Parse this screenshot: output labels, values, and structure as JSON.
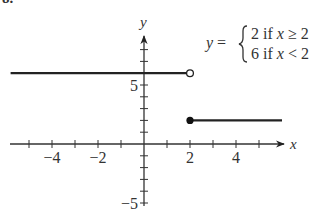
{
  "problem_number": "8.",
  "equation": {
    "lhs": "y =",
    "cases": [
      "2 if x ≥ 2",
      "6 if x < 2"
    ]
  },
  "chart_data": {
    "type": "line",
    "title": "",
    "xlabel": "x",
    "ylabel": "y",
    "xlim": [
      -5.8,
      6
    ],
    "ylim": [
      -5.3,
      8.8
    ],
    "x_ticks": [
      -5,
      -4,
      -3,
      -2,
      -1,
      1,
      2,
      3,
      4,
      5
    ],
    "x_tick_labels": [
      {
        "value": -4,
        "label": "−4"
      },
      {
        "value": -2,
        "label": "−2"
      },
      {
        "value": 2,
        "label": "2"
      },
      {
        "value": 4,
        "label": "4"
      }
    ],
    "y_ticks": [
      -5,
      -4,
      -3,
      -2,
      -1,
      1,
      2,
      3,
      4,
      5,
      6,
      7,
      8
    ],
    "y_tick_labels": [
      {
        "value": 5,
        "label": "5"
      },
      {
        "value": -5,
        "label": "−5"
      }
    ],
    "grid": false,
    "series": [
      {
        "name": "6 if x < 2",
        "x": [
          -5.8,
          2
        ],
        "y": [
          6,
          6
        ],
        "start_marker": "none",
        "end_marker": "open"
      },
      {
        "name": "2 if x ≥ 2",
        "x": [
          2,
          6
        ],
        "y": [
          2,
          2
        ],
        "start_marker": "closed",
        "end_marker": "none"
      }
    ]
  }
}
